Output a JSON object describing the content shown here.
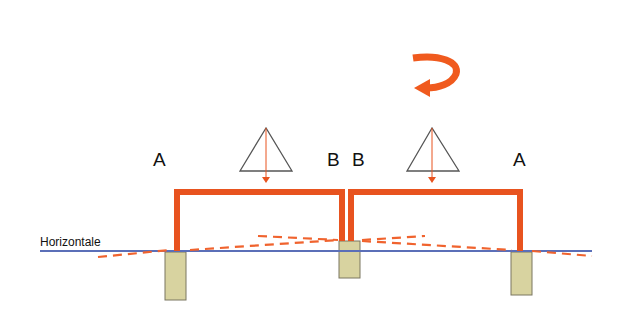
{
  "diagram": {
    "horizontal_label": "Horizontale",
    "labels": {
      "left_frame_left": "A",
      "left_frame_right": "B",
      "right_frame_left": "B",
      "right_frame_right": "A"
    },
    "icons": {
      "rotation": "rotation-arrow-icon",
      "load_left": "triangle-load-icon",
      "load_right": "triangle-load-icon"
    },
    "colors": {
      "frame": "#e8531f",
      "dashed": "#f0632e",
      "horizontal_line": "#5b6fb8",
      "foundation_fill": "#d8d3a0",
      "foundation_stroke": "#7a7660",
      "triangle_stroke": "#555555",
      "load_arrow": "#e8531f"
    }
  }
}
